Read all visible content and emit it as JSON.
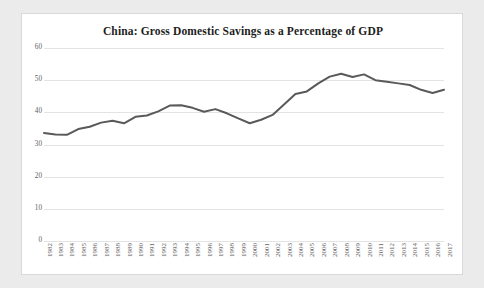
{
  "page": {
    "background_color": "#ebebeb",
    "panel_background_color": "#ffffff",
    "panel_border_color": "#d9d9d9"
  },
  "chart_data": {
    "type": "line",
    "title": "China: Gross Domestic Savings as a Percentage of GDP",
    "subtitle": "",
    "xlabel": "",
    "ylabel": "",
    "ylim": [
      0,
      60
    ],
    "ytick_values": [
      0,
      10,
      20,
      30,
      40,
      50,
      60
    ],
    "ytick_labels": [
      "0",
      "10",
      "20",
      "30",
      "40",
      "50",
      "60"
    ],
    "grid": true,
    "grid_axis": "y",
    "grid_color": "#e3e3e3",
    "legend": false,
    "legend_position": "none",
    "line_color": "#595959",
    "line_width": 2,
    "markers": false,
    "categories": [
      "1982",
      "1983",
      "1984",
      "1985",
      "1986",
      "1987",
      "1988",
      "1989",
      "1990",
      "1991",
      "1992",
      "1993",
      "1994",
      "1995",
      "1996",
      "1997",
      "1998",
      "1999",
      "2000",
      "2001",
      "2002",
      "2003",
      "2004",
      "2005",
      "2006",
      "2007",
      "2008",
      "2009",
      "2010",
      "2011",
      "2012",
      "2013",
      "2014",
      "2015",
      "2016",
      "2017"
    ],
    "values": [
      33.6,
      33.1,
      33.0,
      34.8,
      35.5,
      36.8,
      37.4,
      36.6,
      38.6,
      39.0,
      40.3,
      42.1,
      42.2,
      41.4,
      40.2,
      41.0,
      39.7,
      38.1,
      36.6,
      37.7,
      39.2,
      42.4,
      45.7,
      46.5,
      49.0,
      51.1,
      52.0,
      51.0,
      51.8,
      50.0,
      49.5,
      49.0,
      48.5,
      47.0,
      46.0,
      47.0
    ]
  }
}
